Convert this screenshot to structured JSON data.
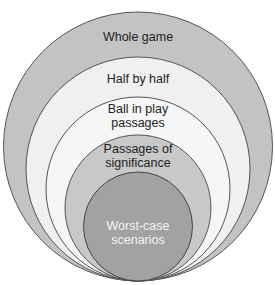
{
  "diagram": {
    "type": "nested-circles",
    "colors": {
      "stroke": "#555555",
      "ring_whole_game": "#c3c3c3",
      "ring_half_by_half": "#f0f0f0",
      "ring_ball_in_play": "#f6f6f6",
      "ring_passages": "#c8c8c8",
      "ring_worst_case": "#a2a2a2",
      "text_dark": "#222222",
      "text_light": "#f4f4f4"
    },
    "levels": [
      {
        "id": "whole-game",
        "lines": [
          "Whole game"
        ]
      },
      {
        "id": "half-by-half",
        "lines": [
          "Half by half"
        ]
      },
      {
        "id": "ball-in-play",
        "lines": [
          "Ball in play",
          "passages"
        ]
      },
      {
        "id": "passages-of-significance",
        "lines": [
          "Passages of",
          "significance"
        ]
      },
      {
        "id": "worst-case",
        "lines": [
          "Worst-case",
          "scenarios"
        ]
      }
    ]
  }
}
